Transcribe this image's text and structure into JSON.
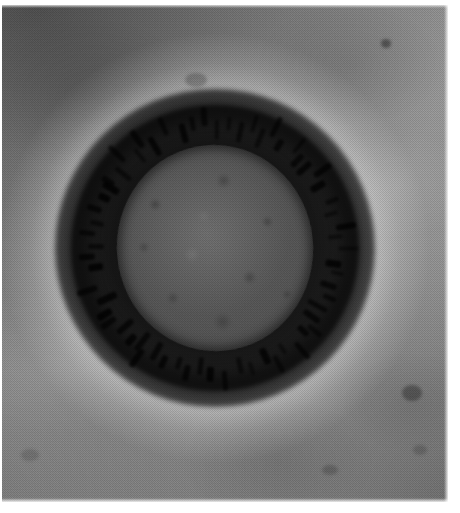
{
  "image": {
    "kind": "transmission-electron-micrograph",
    "subject": "coronavirus virion",
    "modality": "negative-stain TEM",
    "color_mode": "grayscale",
    "caption": "Transmission electron micrograph of a single coronavirus virion showing a dark stained envelope fringed with club-shaped surface spikes (corona) surrounding a mottled grey nucleocapsid core, set against a grainy grey support-film background with a bright halo.",
    "alt_text": "Black and white electron microscope image of a roughly circular virus particle with a dark granular rim and spiky projections, centered on a mottled grey background."
  },
  "colors": {
    "page": "#ffffff",
    "film_light": "#a2a2a2",
    "film_mid": "#8d8d8d",
    "film_dark": "#6b6b6b",
    "halo": "#e8e8e8",
    "envelope": "#141414",
    "core": "#5a5a5a",
    "spike": "#0d0d0d"
  },
  "geometry": {
    "canvas_width": 460,
    "canvas_height": 513,
    "plate_left": 2,
    "plate_top": 5,
    "plate_width": 446,
    "plate_height": 497,
    "virion_center_x": 215,
    "virion_center_y": 248,
    "envelope_radius": 152,
    "core_radius_x": 98,
    "core_radius_y": 103,
    "spike_count": 64
  },
  "features": [
    {
      "name": "viral-envelope",
      "label": "Dark stained lipid envelope"
    },
    {
      "name": "corona-spikes",
      "label": "Club-shaped surface projections (spikes)"
    },
    {
      "name": "nucleocapsid-core",
      "label": "Mottled grey nucleocapsid core"
    },
    {
      "name": "stain-halo",
      "label": "Bright halo of displaced negative stain"
    },
    {
      "name": "support-film",
      "label": "Grainy grey carbon support film"
    }
  ],
  "artifacts": [
    {
      "name": "stain-speck-upper-center",
      "x": 196,
      "y": 80,
      "w": 22,
      "h": 14,
      "opacity": 0.22
    },
    {
      "name": "stain-speck-upper-right",
      "x": 386,
      "y": 43,
      "w": 10,
      "h": 9,
      "opacity": 0.38
    },
    {
      "name": "stain-streak-lower-right",
      "x": 412,
      "y": 393,
      "w": 20,
      "h": 16,
      "opacity": 0.3
    },
    {
      "name": "stain-speck-lower-center",
      "x": 330,
      "y": 470,
      "w": 16,
      "h": 10,
      "opacity": 0.18
    },
    {
      "name": "stain-speck-mid-right",
      "x": 420,
      "y": 450,
      "w": 14,
      "h": 10,
      "opacity": 0.16
    },
    {
      "name": "stain-speck-left-edge",
      "x": 30,
      "y": 455,
      "w": 18,
      "h": 12,
      "opacity": 0.14
    }
  ],
  "margins": {
    "top": 5,
    "left": 2,
    "right": 12,
    "bottom": 11
  }
}
